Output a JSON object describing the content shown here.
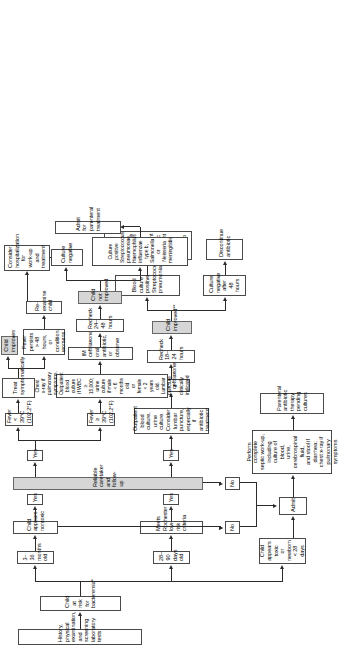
{
  "diagram": {
    "type": "clinical-pathway-flowchart",
    "orientation": "rotated-90-ccw",
    "colors": {
      "box_border": "#4a4a4a",
      "box_fill": "#ffffff",
      "shaded_fill": "#d6d6d6",
      "line": "#2b2b2b"
    },
    "nodes": {
      "history": "History, physical examination, and screening laboratory tests",
      "at_risk": "Child at risk for bacteremia*",
      "toxic_newborn": "Child appears toxic\nor newborn < 28 days",
      "age_28_90": "28–90 days old",
      "age_3_36": "3–36 months old",
      "rochester": "Meets Rochester low-risk criteria",
      "nontoxic": "Child appears nontoxic",
      "reliable": "Reliable caretaker and follow-up",
      "admit": "Admit",
      "septic_workup": "Perform complete\nseptic work-up,\nincluding culture of blood,\nurine, cerebrospinal fluid,\nand stool if diarrhea;\nchest x-ray if\npulmonary symptoms",
      "parenteral": "Parenteral antibiotic\ntherapy pending cultures",
      "outpatient_cultures": "Outpatient blood culture, urine culture.\nConsider lumbar puncture,\nespecially if antibiotic treatment",
      "im_ceftriaxone_1": "IM ceftriaxone",
      "recheck_18_24": "Recheck 18–24 hours",
      "child_improved": "Child improved**",
      "blood_culture_positive": "Blood culture positive\nStreptococcus pneumoniae",
      "culture_negative_48": "Culture negative\nafter 48 hours",
      "repeat_blood_culture": "Repeat blood culture\nComplete 10-day course outpatient\nantibiotic treatment with close follow-up",
      "discontinue_antibiotic": "Discontinue\nantibiotic",
      "fever_ge_39": "Fever ≥ 39°C (102.2°F)",
      "fever_lt_39": "Fever < 39°C (102.2°F)",
      "cxr_wbc": "Chest x-ray if pulmonary symptoms.\nOutpatient blood culture if WBC ≥ 15,000; urine culture if male < 6 months old\nor female < 2 years old. Lumbar puncture if clinically indicated",
      "im_ceftriaxone_2": "IM ceftriaxone, oral antibiotic, or observe",
      "recheck_24_48": "Recheck 24–48 hours",
      "child_not_improved": "Child not improved",
      "culture_positive": "Culture positive\nStreptococcus pneumoniae,\nHaemophilus influenzae type b,\nSalmonella or Neisseria meningitidis",
      "culture_negative": "Culture\nnegative",
      "admit_parenteral": "Admit for parenteral treatment",
      "consider_hospitalization": "Consider hospitalization\nfor work-up and treatment",
      "treat_symptomatically": "Treat\nsymptomatically",
      "child_improves": "Child\nimproves",
      "fever_persists": "Fever persists\n> 48 hours, or\ncondition worsens",
      "re_examine": "Re-examine child"
    },
    "labels": {
      "yes_rochester": "Yes",
      "no_rochester": "No",
      "yes_nontoxic": "Yes",
      "no_nontoxic": "No",
      "yes_reliable_28": "Yes",
      "no_reliable_28": "No",
      "yes_reliable_36": "Yes"
    }
  }
}
